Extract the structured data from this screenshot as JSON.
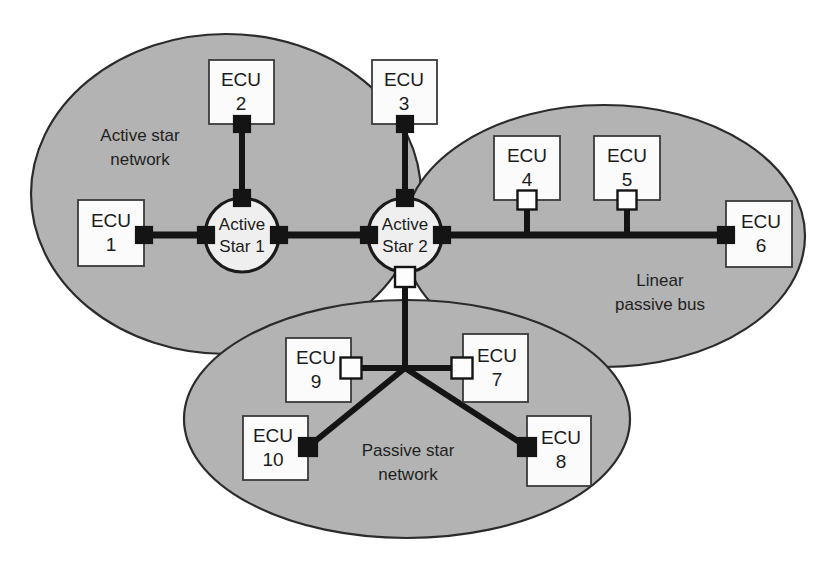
{
  "diagram": {
    "background_color": "#ffffff",
    "region_fill_color": "#b3b3b3",
    "region_stroke_color": "#2b2b2b",
    "hub_fill_color": "#efefef",
    "node_fill_color": "#fbfbfb",
    "link_color": "#141414"
  },
  "regions": [
    {
      "id": "active-star-network",
      "label_line1": "Active star",
      "label_line2": "network",
      "label_x": 140,
      "label_y": 137,
      "cx": 226,
      "cy": 194,
      "rx": 195,
      "ry": 160
    },
    {
      "id": "linear-passive-bus",
      "label_line1": "Linear",
      "label_line2": "passive bus",
      "label_x": 660,
      "label_y": 282,
      "cx": 604,
      "cy": 236,
      "rx": 201,
      "ry": 131
    },
    {
      "id": "passive-star-network",
      "label_line1": "Passive star",
      "label_line2": "network",
      "label_x": 408,
      "label_y": 452,
      "cx": 407,
      "cy": 419,
      "rx": 223,
      "ry": 119
    }
  ],
  "hubs": [
    {
      "id": "active-star-1",
      "label_line1": "Active",
      "label_line2": "Star 1",
      "cx": 242,
      "cy": 235,
      "r": 37
    },
    {
      "id": "active-star-2",
      "label_line1": "Active",
      "label_line2": "Star 2",
      "cx": 405,
      "cy": 235,
      "r": 37
    }
  ],
  "nodes": [
    {
      "id": "ecu-1",
      "line1": "ECU",
      "line2": "1",
      "x": 78,
      "y": 200,
      "w": 66,
      "h": 66
    },
    {
      "id": "ecu-2",
      "line1": "ECU",
      "line2": "2",
      "x": 209,
      "y": 60,
      "w": 65,
      "h": 64
    },
    {
      "id": "ecu-3",
      "line1": "ECU",
      "line2": "3",
      "x": 372,
      "y": 60,
      "w": 65,
      "h": 64
    },
    {
      "id": "ecu-4",
      "line1": "ECU",
      "line2": "4",
      "x": 494,
      "y": 136,
      "w": 66,
      "h": 64
    },
    {
      "id": "ecu-5",
      "line1": "ECU",
      "line2": "5",
      "x": 594,
      "y": 136,
      "w": 66,
      "h": 64
    },
    {
      "id": "ecu-6",
      "line1": "ECU",
      "line2": "6",
      "x": 726,
      "y": 201,
      "w": 66,
      "h": 66
    },
    {
      "id": "ecu-7",
      "line1": "ECU",
      "line2": "7",
      "x": 463,
      "y": 334,
      "w": 65,
      "h": 68
    },
    {
      "id": "ecu-8",
      "line1": "ECU",
      "line2": "8",
      "x": 527,
      "y": 416,
      "w": 64,
      "h": 70
    },
    {
      "id": "ecu-9",
      "line1": "ECU",
      "line2": "9",
      "x": 286,
      "y": 338,
      "w": 65,
      "h": 64
    },
    {
      "id": "ecu-10",
      "line1": "ECU",
      "line2": "10",
      "x": 243,
      "y": 416,
      "w": 65,
      "h": 64
    }
  ],
  "links": [
    {
      "id": "link-ecu1-star1",
      "x1": 144,
      "y1": 235,
      "x2": 242,
      "y2": 235,
      "weight": "thick"
    },
    {
      "id": "link-ecu2-star1",
      "x1": 242,
      "y1": 124,
      "x2": 242,
      "y2": 198,
      "weight": "med"
    },
    {
      "id": "link-star1-star2",
      "x1": 242,
      "y1": 235,
      "x2": 405,
      "y2": 235,
      "weight": "thick"
    },
    {
      "id": "link-ecu3-star2",
      "x1": 405,
      "y1": 124,
      "x2": 405,
      "y2": 198,
      "weight": "med"
    },
    {
      "id": "link-star2-bus",
      "x1": 405,
      "y1": 235,
      "x2": 726,
      "y2": 235,
      "weight": "thick"
    },
    {
      "id": "link-ecu4-bus",
      "x1": 527,
      "y1": 200,
      "x2": 527,
      "y2": 235,
      "weight": "med"
    },
    {
      "id": "link-ecu5-bus",
      "x1": 627,
      "y1": 200,
      "x2": 627,
      "y2": 235,
      "weight": "med"
    },
    {
      "id": "link-star2-junction",
      "x1": 405,
      "y1": 272,
      "x2": 405,
      "y2": 368,
      "weight": "med"
    },
    {
      "id": "link-junction-ecu9",
      "x1": 405,
      "y1": 368,
      "x2": 351,
      "y2": 368,
      "weight": "med"
    },
    {
      "id": "link-junction-ecu7",
      "x1": 405,
      "y1": 368,
      "x2": 462,
      "y2": 368,
      "weight": "med"
    },
    {
      "id": "link-junction-ecu10",
      "x1": 405,
      "y1": 368,
      "x2": 308,
      "y2": 447,
      "weight": "med"
    },
    {
      "id": "link-junction-ecu8",
      "x1": 405,
      "y1": 368,
      "x2": 527,
      "y2": 447,
      "weight": "med"
    }
  ],
  "connectors": [
    {
      "id": "conn-ecu1",
      "type": "dark",
      "cx": 144,
      "cy": 235,
      "size": 17
    },
    {
      "id": "conn-star1-left",
      "type": "dark",
      "cx": 206,
      "cy": 235,
      "size": 17
    },
    {
      "id": "conn-ecu2",
      "type": "dark",
      "cx": 242,
      "cy": 124,
      "size": 17
    },
    {
      "id": "conn-star1-top",
      "type": "dark",
      "cx": 242,
      "cy": 198,
      "size": 17
    },
    {
      "id": "conn-star1-right",
      "type": "dark",
      "cx": 279,
      "cy": 235,
      "size": 17
    },
    {
      "id": "conn-star2-left",
      "type": "dark",
      "cx": 369,
      "cy": 235,
      "size": 17
    },
    {
      "id": "conn-ecu3",
      "type": "dark",
      "cx": 405,
      "cy": 124,
      "size": 17
    },
    {
      "id": "conn-star2-top",
      "type": "dark",
      "cx": 405,
      "cy": 198,
      "size": 17
    },
    {
      "id": "conn-star2-right",
      "type": "dark",
      "cx": 442,
      "cy": 235,
      "size": 17
    },
    {
      "id": "conn-star2-bot",
      "type": "light",
      "cx": 405,
      "cy": 277,
      "size": 20
    },
    {
      "id": "conn-ecu4",
      "type": "light",
      "cx": 527,
      "cy": 200,
      "size": 19
    },
    {
      "id": "conn-ecu5",
      "type": "light",
      "cx": 627,
      "cy": 200,
      "size": 19
    },
    {
      "id": "conn-ecu6",
      "type": "dark",
      "cx": 726,
      "cy": 235,
      "size": 17
    },
    {
      "id": "conn-ecu9",
      "type": "light",
      "cx": 351,
      "cy": 368,
      "size": 21
    },
    {
      "id": "conn-ecu7",
      "type": "light",
      "cx": 462,
      "cy": 368,
      "size": 21
    },
    {
      "id": "conn-ecu10",
      "type": "dark",
      "cx": 308,
      "cy": 447,
      "size": 19
    },
    {
      "id": "conn-ecu8",
      "type": "dark",
      "cx": 527,
      "cy": 447,
      "size": 19
    }
  ]
}
